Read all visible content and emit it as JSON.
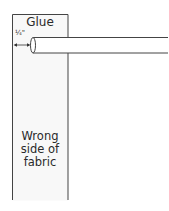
{
  "diagram": {
    "labels": {
      "glue": "Glue",
      "measurement": "¼\"",
      "fabric": "Wrong side of fabric"
    },
    "fabric_lines": [
      "Wrong",
      "side of",
      "fabric"
    ],
    "elements": {
      "fabric_strip": {
        "x": 12,
        "y": 14,
        "width": 56,
        "bottom": 199,
        "fill": "#f7f7f7",
        "stroke": "#444444"
      },
      "rod": {
        "x_start": 31,
        "x_end": 168,
        "y_top": 37,
        "y_bottom": 53,
        "stroke": "#444444"
      },
      "dimension_arrow": {
        "from_x": 14,
        "to_x": 30,
        "y": 45
      }
    }
  }
}
